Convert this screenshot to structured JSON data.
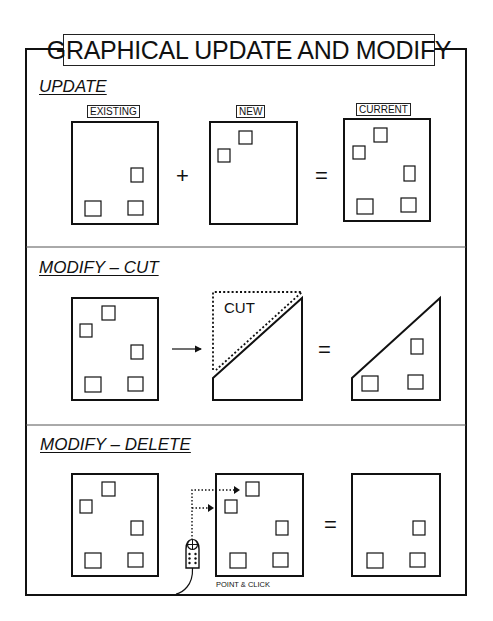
{
  "title": "GRAPHICAL UPDATE AND MODIFY",
  "sections": {
    "update": {
      "title": "UPDATE",
      "frames": [
        {
          "label": "EXISTING"
        },
        {
          "label": "NEW"
        },
        {
          "label": "CURRENT"
        }
      ],
      "operators": [
        "+",
        "="
      ]
    },
    "cut": {
      "title": "MODIFY – CUT",
      "cut_label": "CUT",
      "operators": [
        "→",
        "="
      ]
    },
    "delete": {
      "title": "MODIFY – DELETE",
      "caption": "POINT & CLICK",
      "operators": [
        "="
      ]
    }
  },
  "colors": {
    "line": "#111111",
    "background": "#ffffff"
  }
}
